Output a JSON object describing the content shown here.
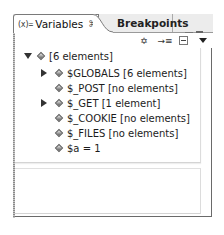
{
  "tabs": [
    {
      "label": "Variables",
      "icon": "(x)=",
      "active": true,
      "close": "⌘"
    },
    {
      "label": "Breakpoints",
      "active": false
    }
  ],
  "toolbar": {
    "items": [
      "show-type-names-icon",
      "logical-structure-icon",
      "collapse-all-icon",
      "view-menu-icon"
    ],
    "type_names_glyph": "✡",
    "logical_glyph": "→≡"
  },
  "tree": {
    "root": {
      "label": "[6 elements]",
      "expanded": true
    },
    "children": [
      {
        "label": "$GLOBALS [6 elements]",
        "expandable": true
      },
      {
        "label": "$_POST [no elements]",
        "expandable": false
      },
      {
        "label": "$_GET [1 element]",
        "expandable": true
      },
      {
        "label": "$_COOKIE [no elements]",
        "expandable": false
      },
      {
        "label": "$_FILES [no elements]",
        "expandable": false
      },
      {
        "label": "$a = 1",
        "expandable": false
      }
    ]
  },
  "detail_pane": {
    "text": ""
  }
}
